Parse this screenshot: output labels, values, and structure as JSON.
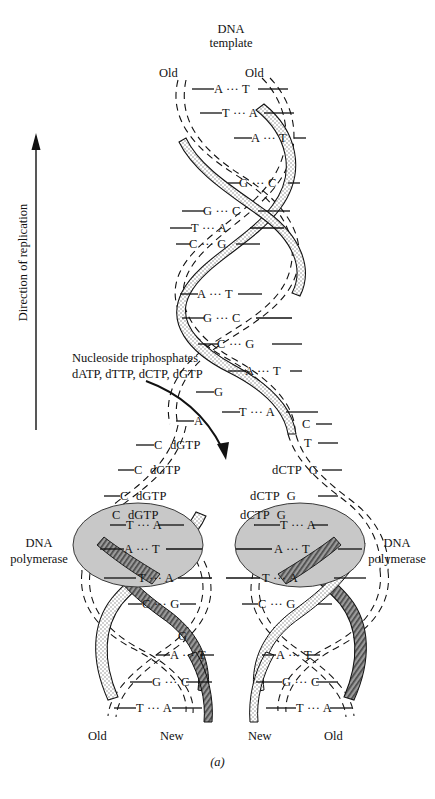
{
  "figure": {
    "panel_letter": "(a)",
    "title_top": {
      "line1": "DNA",
      "line2": "template"
    },
    "direction_label": "Direction of replication",
    "colors": {
      "old_strand_ribbon": "#d8d8d8",
      "new_strand_ribbon": "#6f6f6f",
      "polymerase_ellipse": "#c8c8c8",
      "line": "#111111",
      "background": "#ffffff"
    }
  },
  "top_labels": {
    "old_left": "Old",
    "old_right": "Old"
  },
  "bottom_labels": {
    "left_fork_left": "Old",
    "left_fork_right": "New",
    "right_fork_left": "New",
    "right_fork_right": "Old"
  },
  "annotations": {
    "nucleoside_line1": "Nucleoside triphosphates",
    "nucleoside_line2": "dATP, dTTP, dCTP, dGTP",
    "polymerase_left_line1": "DNA",
    "polymerase_left_line2": "polymerase",
    "polymerase_right_line1": "DNA",
    "polymerase_right_line2": "polymerase"
  },
  "base_pairs_trunk": [
    {
      "left": "A",
      "bond": "···",
      "right": "T"
    },
    {
      "left": "T",
      "bond": "···",
      "right": "A"
    },
    {
      "left": "A",
      "bond": "···",
      "right": "T"
    },
    {
      "left": "G",
      "bond": "···",
      "right": "C"
    },
    {
      "left": "G",
      "bond": "···",
      "right": "C"
    },
    {
      "left": "T",
      "bond": "···",
      "right": "A"
    },
    {
      "left": "C",
      "bond": "···",
      "right": "G"
    },
    {
      "left": "A",
      "bond": "···",
      "right": "T"
    },
    {
      "left": "G",
      "bond": "···",
      "right": "C"
    },
    {
      "left": "C",
      "bond": "···",
      "right": "G"
    },
    {
      "left": "A",
      "bond": "···",
      "right": "T"
    },
    {
      "left": "T",
      "bond": "···",
      "right": "A"
    }
  ],
  "unpaired_left_fork": [
    {
      "base": "G",
      "reagent": ""
    },
    {
      "base": "A",
      "reagent": ""
    },
    {
      "base": "C",
      "reagent": "dGTP"
    },
    {
      "base": "C",
      "reagent": "dGTP"
    },
    {
      "base": "C",
      "reagent": "dGTP"
    }
  ],
  "unpaired_right_fork": [
    {
      "base": "C",
      "reagent": ""
    },
    {
      "base": "T",
      "reagent": ""
    },
    {
      "base": "G",
      "reagent": "dCTP"
    },
    {
      "base": "G",
      "reagent": "dCTP"
    },
    {
      "base": "G",
      "reagent": "dCTP"
    }
  ],
  "base_pairs_left_fork": [
    {
      "left": "T",
      "bond": "···",
      "right": "A"
    },
    {
      "left": "A",
      "bond": "···",
      "right": "T"
    },
    {
      "left": "T",
      "bond": "···",
      "right": "A"
    },
    {
      "left": "C",
      "bond": "···",
      "right": "G"
    },
    {
      "left": "G",
      "bond": "",
      "right": ""
    },
    {
      "left": "A",
      "bond": "···",
      "right": "T"
    },
    {
      "left": "G",
      "bond": "···",
      "right": "C"
    },
    {
      "left": "T",
      "bond": "···",
      "right": "A"
    }
  ],
  "base_pairs_right_fork": [
    {
      "left": "T",
      "bond": "···",
      "right": "A"
    },
    {
      "left": "A",
      "bond": "···",
      "right": "T"
    },
    {
      "left": "T",
      "bond": "···",
      "right": "A"
    },
    {
      "left": "C",
      "bond": "···",
      "right": "G"
    },
    {
      "left": "A",
      "bond": "···",
      "right": "T"
    },
    {
      "left": "G",
      "bond": "···",
      "right": "C"
    },
    {
      "left": "T",
      "bond": "···",
      "right": "A"
    }
  ]
}
